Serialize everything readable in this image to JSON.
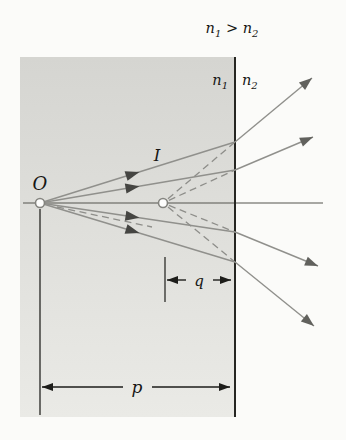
{
  "labels": {
    "condition": [
      {
        "t": "n"
      },
      {
        "t": "1",
        "sub": true
      },
      {
        "t": " > "
      },
      {
        "t": "n"
      },
      {
        "t": "2",
        "sub": true
      }
    ],
    "medium1": [
      {
        "t": "n"
      },
      {
        "t": "1",
        "sub": true
      }
    ],
    "medium2": [
      {
        "t": "n"
      },
      {
        "t": "2",
        "sub": true
      }
    ],
    "object_point": "O",
    "image_point": "I",
    "object_distance": "p",
    "image_distance": "q"
  },
  "colors": {
    "background": "#fbfbf9",
    "medium1_top": "#d5d5d1",
    "medium1_bottom": "#eaeae6",
    "boundary": "#262622",
    "axis": "#54544e",
    "ray": "#90908c",
    "ray_dashed": "#8e8e8a",
    "arrow_mid": "#454542",
    "arrow_tip": "#61615d",
    "dimension": "#1d1d1a",
    "text": "#161614",
    "point_fill": "#fdfdfc",
    "point_stroke": "#84847f"
  },
  "geometry": {
    "canvas": {
      "w": 346,
      "h": 440
    },
    "medium1_region": {
      "x": 20,
      "y": 57,
      "w": 215,
      "h": 360
    },
    "boundary": {
      "x": 235,
      "y1": 57,
      "y2": 417
    },
    "axis": {
      "x1": 23,
      "x2": 323,
      "y": 203
    },
    "object_vertical": {
      "x": 40,
      "y1": 209,
      "y2": 415
    },
    "object_point": {
      "x": 40,
      "y": 203,
      "r": 4.5
    },
    "image_point": {
      "x": 163,
      "y": 203,
      "r": 4.5
    },
    "rays": [
      {
        "hit_x": 235,
        "hit_y": 142,
        "tip_x": 312,
        "tip_y": 78
      },
      {
        "hit_x": 235,
        "hit_y": 170,
        "tip_x": 313,
        "tip_y": 137
      },
      {
        "hit_x": 235,
        "hit_y": 232,
        "tip_x": 318,
        "tip_y": 266
      },
      {
        "hit_x": 235,
        "hit_y": 262,
        "tip_x": 314,
        "tip_y": 326
      }
    ],
    "mid_arrow_t": 0.51,
    "extra_dashed": {
      "x1": 57,
      "y1": 207,
      "x2": 152,
      "y2": 227
    },
    "q_dim": {
      "y": 280,
      "x1": 167,
      "x2": 231,
      "tick_x": 165,
      "tick_y1": 257,
      "tick_y2": 302,
      "gap1": 186,
      "gap2": 213,
      "label_x": 199,
      "label_y": 286
    },
    "p_dim": {
      "y": 387,
      "x1": 42,
      "x2": 230,
      "gap1": 123,
      "gap2": 152,
      "label_x": 137,
      "label_y": 393
    },
    "label_pos": {
      "condition": {
        "x": 232,
        "y": 33,
        "anchor": "middle"
      },
      "medium1": {
        "x": 228,
        "y": 85,
        "anchor": "end"
      },
      "medium2": {
        "x": 242,
        "y": 85,
        "anchor": "start"
      },
      "object_point": {
        "x": 40,
        "y": 190,
        "anchor": "middle"
      },
      "image_point": {
        "x": 157,
        "y": 161,
        "anchor": "middle"
      }
    }
  }
}
